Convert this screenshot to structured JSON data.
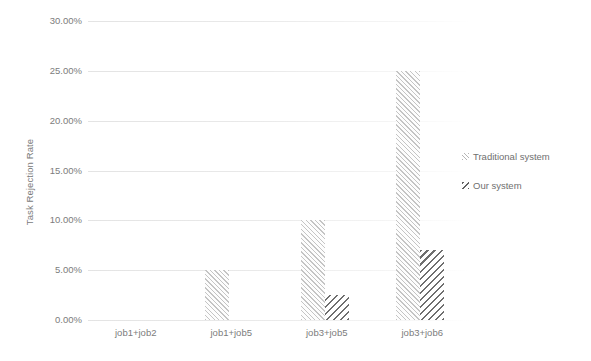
{
  "chart_data": {
    "type": "bar",
    "title": "",
    "xlabel": "",
    "ylabel": "Task Rejection Rate",
    "categories": [
      "job1+job2",
      "job1+job5",
      "job3+job5",
      "job3+job6"
    ],
    "series": [
      {
        "name": "Traditional system",
        "values": [
          0.0,
          5.0,
          10.0,
          25.0
        ],
        "hatch": "forward-slash",
        "color": "#969696"
      },
      {
        "name": "Our system",
        "values": [
          0.0,
          0.0,
          2.5,
          7.0
        ],
        "hatch": "back-slash",
        "color": "#464646"
      }
    ],
    "ylim": [
      0,
      30
    ],
    "ytick_labels": [
      "0.00%",
      "5.00%",
      "10.00%",
      "15.00%",
      "20.00%",
      "25.00%",
      "30.00%"
    ],
    "ytick_values": [
      0,
      5,
      10,
      15,
      20,
      25,
      30
    ],
    "yunit": "%",
    "grid": true,
    "legend_position": "right",
    "legend": [
      "Traditional system",
      "Our system"
    ]
  }
}
